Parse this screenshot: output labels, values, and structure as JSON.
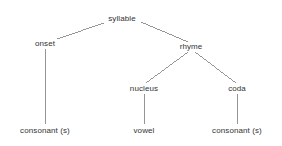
{
  "diagram": {
    "type": "tree",
    "background_color": "#ffffff",
    "line_color": "#8a8a8a",
    "text_color": "#333333",
    "nodes": [
      {
        "id": "syllable",
        "label": "syllable",
        "x": 122,
        "y": 19,
        "level": 0
      },
      {
        "id": "onset",
        "label": "onset",
        "x": 45,
        "y": 44,
        "level": 1
      },
      {
        "id": "rhyme",
        "label": "rhyme",
        "x": 191,
        "y": 47,
        "level": 1
      },
      {
        "id": "nucleus",
        "label": "nucleus",
        "x": 144,
        "y": 89,
        "level": 2
      },
      {
        "id": "coda",
        "label": "coda",
        "x": 237,
        "y": 89,
        "level": 2
      },
      {
        "id": "onset-leaf",
        "label": "consonant (s)",
        "x": 45,
        "y": 131,
        "level": 3
      },
      {
        "id": "vowel",
        "label": "vowel",
        "x": 144,
        "y": 131,
        "level": 3
      },
      {
        "id": "coda-leaf",
        "label": "consonant (s)",
        "x": 237,
        "y": 131,
        "level": 3
      }
    ],
    "edges": [
      {
        "from": "syllable",
        "to": "onset",
        "x1": 104,
        "y1": 23,
        "x2": 57,
        "y2": 39
      },
      {
        "from": "syllable",
        "to": "rhyme",
        "x1": 141,
        "y1": 22,
        "x2": 188,
        "y2": 42
      },
      {
        "from": "onset",
        "to": "onset-leaf",
        "x1": 45,
        "y1": 49,
        "x2": 45,
        "y2": 124
      },
      {
        "from": "rhyme",
        "to": "nucleus",
        "x1": 188,
        "y1": 52,
        "x2": 146,
        "y2": 83
      },
      {
        "from": "rhyme",
        "to": "coda",
        "x1": 195,
        "y1": 52,
        "x2": 236,
        "y2": 83
      },
      {
        "from": "nucleus",
        "to": "vowel",
        "x1": 144,
        "y1": 94,
        "x2": 144,
        "y2": 124
      },
      {
        "from": "coda",
        "to": "coda-leaf",
        "x1": 237,
        "y1": 94,
        "x2": 237,
        "y2": 124
      }
    ]
  }
}
